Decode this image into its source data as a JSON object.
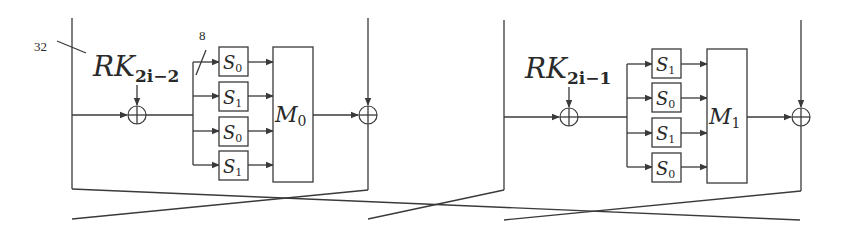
{
  "diagram": {
    "type": "block-cipher-round-structure",
    "colors": {
      "stroke": "#3a3a3a",
      "text": "#2a2a2a",
      "background": "#ffffff"
    },
    "annotations": {
      "bus_width_main": "32",
      "bus_width_branch": "8"
    },
    "blocks": [
      {
        "id": "F0",
        "round_key": {
          "base": "RK",
          "subscript": "2i−2"
        },
        "sboxes": [
          {
            "base": "S",
            "sub": "0"
          },
          {
            "base": "S",
            "sub": "1"
          },
          {
            "base": "S",
            "sub": "0"
          },
          {
            "base": "S",
            "sub": "1"
          }
        ],
        "matrix": {
          "base": "M",
          "sub": "0"
        }
      },
      {
        "id": "F1",
        "round_key": {
          "base": "RK",
          "subscript": "2i−1"
        },
        "sboxes": [
          {
            "base": "S",
            "sub": "1"
          },
          {
            "base": "S",
            "sub": "0"
          },
          {
            "base": "S",
            "sub": "1"
          },
          {
            "base": "S",
            "sub": "0"
          }
        ],
        "matrix": {
          "base": "M",
          "sub": "1"
        }
      }
    ],
    "xor_symbol": "⊕"
  }
}
